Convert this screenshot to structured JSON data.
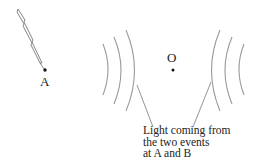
{
  "points": {
    "A": {
      "label": "A"
    },
    "O": {
      "label": "O"
    }
  },
  "caption": {
    "lines": [
      "Light coming from",
      "the two events",
      "at A and B"
    ]
  },
  "colors": {
    "arc": "#9a9a9a",
    "dot": "#111111",
    "text": "#222222",
    "bolt": "#888888"
  }
}
